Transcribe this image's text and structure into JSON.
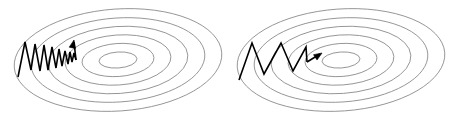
{
  "figure": {
    "background_color": "#ffffff",
    "width": 457,
    "height": 120
  },
  "style": {
    "contour_color": "#8a8a8a",
    "contour_stroke_width": 0.9,
    "trajectory_color": "#000000",
    "trajectory_stroke_width": 1.6,
    "arrow_color": "#000000"
  },
  "panels": [
    {
      "id": "left-panel",
      "name": "left-contour-panel",
      "label": "",
      "center_x": 118,
      "center_y": 60,
      "rotation_deg": -4,
      "ring_count": 6,
      "rings": [
        {
          "rx": 104,
          "ry": 51
        },
        {
          "rx": 87,
          "ry": 42
        },
        {
          "rx": 70,
          "ry": 33.5
        },
        {
          "rx": 53,
          "ry": 25
        },
        {
          "rx": 36,
          "ry": 16.5
        },
        {
          "rx": 19,
          "ry": 8
        }
      ],
      "trajectory": {
        "name": "left-zigzag-trajectory",
        "description": "many tight high-frequency oscillations converging slowly",
        "step_count": 13,
        "points": [
          [
            18,
            77
          ],
          [
            25,
            42
          ],
          [
            31,
            70
          ],
          [
            35,
            44
          ],
          [
            40,
            71
          ],
          [
            44,
            45
          ],
          [
            48,
            70
          ],
          [
            52,
            47
          ],
          [
            56,
            68
          ],
          [
            59,
            49
          ],
          [
            62,
            66
          ],
          [
            65,
            51
          ],
          [
            68,
            64
          ],
          [
            70,
            52
          ],
          [
            72,
            62
          ],
          [
            74,
            53
          ],
          [
            76,
            60
          ]
        ],
        "arrow": {
          "name": "left-arrow-head",
          "tip_x": 74,
          "tip_y": 40,
          "angle_deg": -78
        },
        "arrow_stem": [
          [
            76,
            60
          ],
          [
            74,
            42
          ]
        ]
      }
    },
    {
      "id": "right-panel",
      "name": "right-contour-panel",
      "label": "",
      "center_x": 341,
      "center_y": 60,
      "rotation_deg": -4,
      "ring_count": 6,
      "rings": [
        {
          "rx": 104,
          "ry": 51
        },
        {
          "rx": 87,
          "ry": 42
        },
        {
          "rx": 70,
          "ry": 33.5
        },
        {
          "rx": 53,
          "ry": 25
        },
        {
          "rx": 36,
          "ry": 16.5
        },
        {
          "rx": 19,
          "ry": 8
        }
      ],
      "trajectory": {
        "name": "right-zigzag-trajectory",
        "description": "fewer wider oscillations converging quickly",
        "step_count": 6,
        "points": [
          [
            239,
            80
          ],
          [
            252,
            43
          ],
          [
            264,
            74
          ],
          [
            281,
            43
          ],
          [
            293,
            71
          ],
          [
            306,
            47
          ],
          [
            307,
            62
          ]
        ],
        "arrow": {
          "name": "right-arrow-head",
          "tip_x": 322,
          "tip_y": 53,
          "angle_deg": -33
        },
        "arrow_stem": [
          [
            307,
            62
          ],
          [
            320,
            54
          ]
        ]
      }
    }
  ]
}
